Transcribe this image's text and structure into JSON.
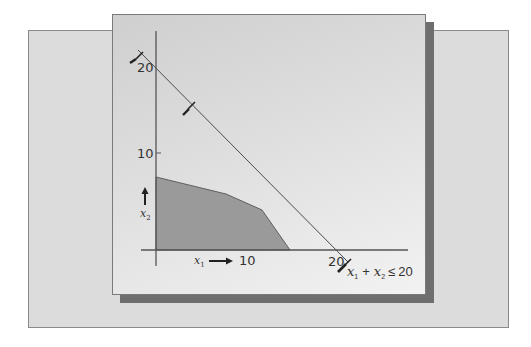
{
  "figure": {
    "y_axis": {
      "ticks": [
        {
          "label": "20",
          "value": 20
        },
        {
          "label": "10",
          "value": 10
        }
      ],
      "variable": "x",
      "variable_subscript": "2"
    },
    "x_axis": {
      "ticks": [
        {
          "label": "10",
          "value": 10
        },
        {
          "label": "20",
          "value": 20
        }
      ],
      "variable": "x",
      "variable_subscript": "1"
    },
    "constraint": {
      "lhs_var1": "x",
      "lhs_sub1": "1",
      "plus": "+",
      "lhs_var2": "x",
      "lhs_sub2": "2",
      "relation": "≤",
      "rhs": "20",
      "line": {
        "x_intercept": 20,
        "y_intercept": 20
      }
    },
    "feasible_region": {
      "vertices": [
        [
          0,
          0
        ],
        [
          0,
          7.5
        ],
        [
          5.5,
          6.2
        ],
        [
          8.2,
          4.7
        ],
        [
          10.5,
          0
        ]
      ],
      "fill_color": "#9a9a9a"
    },
    "colors": {
      "outer_panel": "#dcdcdc",
      "card": "#e6e6e6",
      "shadow": "#6e6e6e",
      "axis": "#555555",
      "constraint_line": "#4a4a4a"
    }
  }
}
